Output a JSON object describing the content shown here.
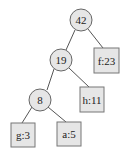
{
  "tree": {
    "nodes": [
      {
        "id": "n42",
        "label": "42",
        "shape": "circle",
        "cx": 81,
        "cy": 20
      },
      {
        "id": "n19",
        "label": "19",
        "shape": "circle",
        "cx": 61,
        "cy": 60
      },
      {
        "id": "f23",
        "label": "f:23",
        "shape": "box",
        "cx": 106,
        "cy": 61
      },
      {
        "id": "n8",
        "label": "8",
        "shape": "circle",
        "cx": 40,
        "cy": 100
      },
      {
        "id": "h11",
        "label": "h:11",
        "shape": "box",
        "cx": 92,
        "cy": 100
      },
      {
        "id": "g3",
        "label": "g:3",
        "shape": "box",
        "cx": 23,
        "cy": 135
      },
      {
        "id": "a5",
        "label": "a:5",
        "shape": "box",
        "cx": 69,
        "cy": 134
      }
    ],
    "edges": [
      [
        "n42",
        "n19"
      ],
      [
        "n42",
        "f23"
      ],
      [
        "n19",
        "n8"
      ],
      [
        "n19",
        "h11"
      ],
      [
        "n8",
        "g3"
      ],
      [
        "n8",
        "a5"
      ]
    ]
  }
}
